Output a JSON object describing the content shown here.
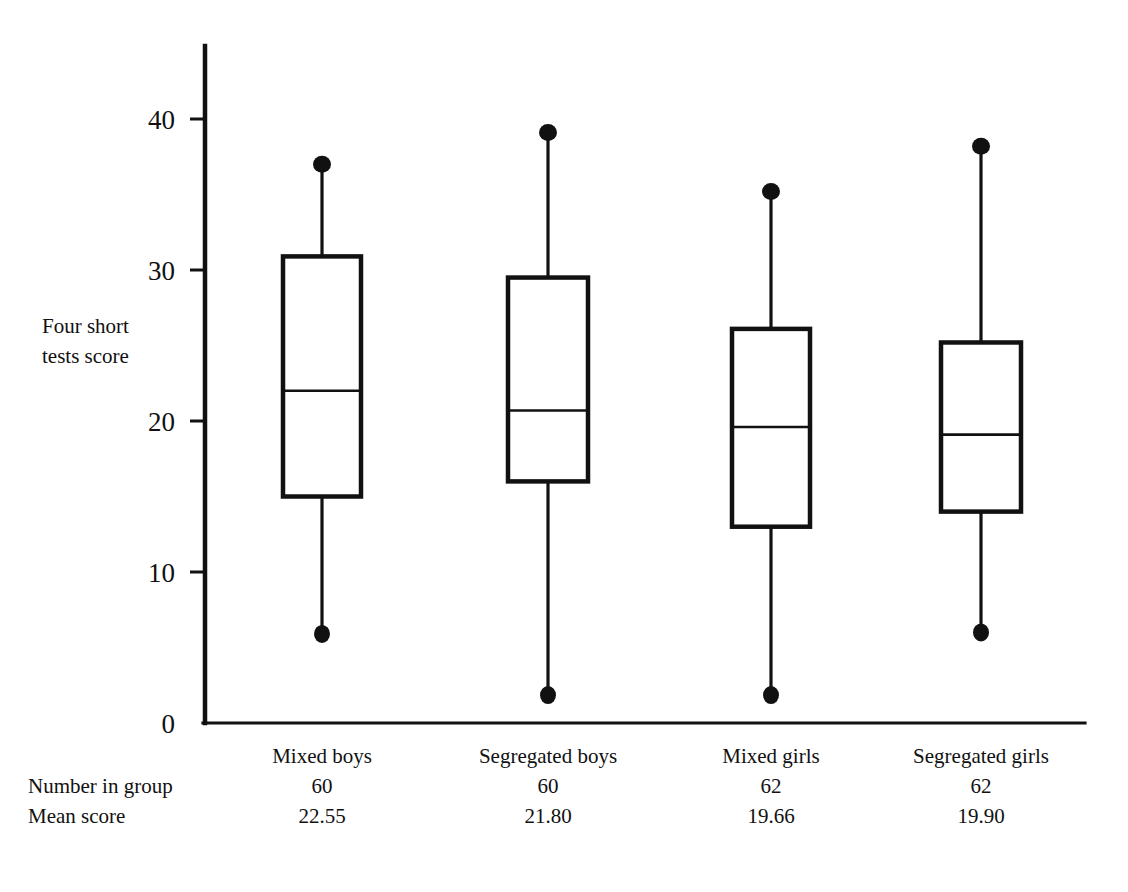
{
  "figure": {
    "y_axis_title": "Four short\ntests score",
    "axis_color": "#111111"
  },
  "chart_data": {
    "type": "box",
    "title": "",
    "xlabel": "",
    "ylabel": "Four short tests score",
    "ylim": [
      0,
      45
    ],
    "yticks": [
      0,
      10,
      20,
      30,
      40
    ],
    "ytick_labels": [
      "0",
      "10",
      "20",
      "30",
      "40"
    ],
    "grid": false,
    "legend": "none",
    "categories": [
      "Mixed boys",
      "Segregated boys",
      "Mixed girls",
      "Segregated girls"
    ],
    "boxes": [
      {
        "name": "Mixed boys",
        "whisker_high": 37.0,
        "q3": 30.9,
        "median": 22.0,
        "q1": 15.0,
        "whisker_low": 5.9,
        "n": 60,
        "mean": 22.55
      },
      {
        "name": "Segregated boys",
        "whisker_high": 39.1,
        "q3": 29.5,
        "median": 20.7,
        "q1": 16.0,
        "whisker_low": 1.85,
        "n": 60,
        "mean": 21.8
      },
      {
        "name": "Mixed girls",
        "whisker_high": 35.2,
        "q3": 26.1,
        "median": 19.6,
        "q1": 13.0,
        "whisker_low": 1.85,
        "n": 62,
        "mean": 19.66
      },
      {
        "name": "Segregated girls",
        "whisker_high": 38.2,
        "q3": 25.2,
        "median": 19.1,
        "q1": 14.0,
        "whisker_low": 6.0,
        "n": 62,
        "mean": 19.9
      }
    ]
  },
  "table": {
    "group_row_label": "",
    "number_row_label": "Number in group",
    "mean_row_label": "Mean score",
    "groups": [
      "Mixed boys",
      "Segregated boys",
      "Mixed girls",
      "Segregated girls"
    ],
    "numbers": [
      "60",
      "60",
      "62",
      "62"
    ],
    "means": [
      "22.55",
      "21.80",
      "19.66",
      "19.90"
    ]
  }
}
